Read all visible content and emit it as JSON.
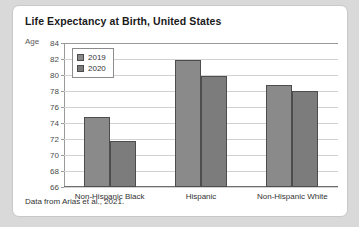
{
  "card": {
    "source_note": "Data from Arias et al., 2021."
  },
  "chart_data": {
    "type": "bar",
    "title": "Life Expectancy at Birth, United States",
    "xlabel": "",
    "ylabel": "Age",
    "ylim": [
      66,
      84
    ],
    "ytick_step": 2,
    "yticks": [
      84,
      82,
      80,
      78,
      76,
      74,
      72,
      70,
      68,
      66
    ],
    "grid": true,
    "legend_position": "top-left",
    "categories": [
      "Non-Hispanic Black",
      "Hispanic",
      "Non-Hispanic White"
    ],
    "series": [
      {
        "name": "2019",
        "color": "#8a8a8a",
        "values": [
          74.8,
          81.9,
          78.8
        ]
      },
      {
        "name": "2020",
        "color": "#7c7c7c",
        "values": [
          71.8,
          79.9,
          78.0
        ]
      }
    ]
  }
}
